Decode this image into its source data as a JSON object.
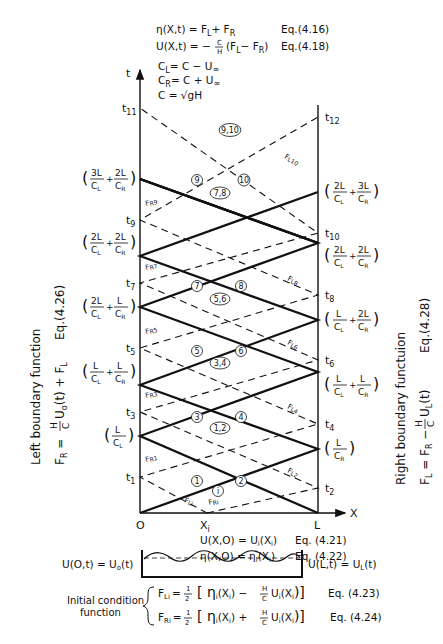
{
  "header_equations": {
    "eta": {
      "lhs": "η(X,t) = F",
      "sub1": "L",
      "mid": "+ F",
      "sub2": "R",
      "ref": "Eq.(4.16)"
    },
    "u": {
      "lhs": "U(X,t) = −",
      "frac_num": "C",
      "frac_den": "H",
      "rest": "(F",
      "sub1": "L",
      "mid": "− F",
      "sub2": "R",
      "close": ")",
      "ref": "Eq.(4.18)"
    },
    "cl": {
      "lhs": "C",
      "sub": "L",
      "rhs": "= C − U",
      "tail": "∞"
    },
    "cr": {
      "lhs": "C",
      "sub": "R",
      "rhs": "= C + U",
      "tail": "∞"
    },
    "c": {
      "text": "C = √gH"
    }
  },
  "axes": {
    "t_label": "t",
    "x_label": "X",
    "origin": "O",
    "right_end": "L",
    "xi": "X",
    "xi_sub": "i"
  },
  "left_time_marks": [
    {
      "id": "t1",
      "base": "t",
      "sub": "1"
    },
    {
      "id": "t3",
      "base": "t",
      "sub": "3"
    },
    {
      "id": "t5",
      "base": "t",
      "sub": "5"
    },
    {
      "id": "t7",
      "base": "t",
      "sub": "7"
    },
    {
      "id": "t9",
      "base": "t",
      "sub": "9"
    },
    {
      "id": "t11",
      "base": "t",
      "sub": "11"
    }
  ],
  "right_time_marks": [
    {
      "id": "t2",
      "base": "t",
      "sub": "2"
    },
    {
      "id": "t4",
      "base": "t",
      "sub": "4"
    },
    {
      "id": "t6",
      "base": "t",
      "sub": "6"
    },
    {
      "id": "t8",
      "base": "t",
      "sub": "8"
    },
    {
      "id": "t10",
      "base": "t",
      "sub": "10"
    },
    {
      "id": "t12",
      "base": "t",
      "sub": "12"
    }
  ],
  "left_time_expressions": [
    {
      "terms": [
        {
          "num": "L",
          "den": "C",
          "den_sub": "L"
        }
      ]
    },
    {
      "terms": [
        {
          "num": "L",
          "den": "C",
          "den_sub": "L"
        },
        {
          "num": "L",
          "den": "C",
          "den_sub": "R"
        }
      ]
    },
    {
      "terms": [
        {
          "num": "2L",
          "den": "C",
          "den_sub": "L"
        },
        {
          "num": "L",
          "den": "C",
          "den_sub": "R"
        }
      ]
    },
    {
      "terms": [
        {
          "num": "2L",
          "den": "C",
          "den_sub": "L"
        },
        {
          "num": "2L",
          "den": "C",
          "den_sub": "R"
        }
      ]
    },
    {
      "terms": [
        {
          "num": "3L",
          "den": "C",
          "den_sub": "L"
        },
        {
          "num": "2L",
          "den": "C",
          "den_sub": "R"
        }
      ]
    }
  ],
  "right_time_expressions": [
    {
      "terms": [
        {
          "num": "L",
          "den": "C",
          "den_sub": "R"
        }
      ]
    },
    {
      "terms": [
        {
          "num": "L",
          "den": "C",
          "den_sub": "L"
        },
        {
          "num": "L",
          "den": "C",
          "den_sub": "R"
        }
      ]
    },
    {
      "terms": [
        {
          "num": "L",
          "den": "C",
          "den_sub": "L"
        },
        {
          "num": "2L",
          "den": "C",
          "den_sub": "R"
        }
      ]
    },
    {
      "terms": [
        {
          "num": "2L",
          "den": "C",
          "den_sub": "L"
        },
        {
          "num": "2L",
          "den": "C",
          "den_sub": "R"
        }
      ]
    },
    {
      "terms": [
        {
          "num": "2L",
          "den": "C",
          "den_sub": "L"
        },
        {
          "num": "3L",
          "den": "C",
          "den_sub": "R"
        }
      ]
    }
  ],
  "region_labels": [
    "i",
    "1",
    "2",
    "1,2",
    "3",
    "4",
    "3,4",
    "5",
    "6",
    "5,6",
    "7",
    "8",
    "7,8",
    "9",
    "10",
    "9,10"
  ],
  "characteristic_labels": {
    "left_side": [
      "F",
      "R1",
      "R3",
      "R5",
      "R7",
      "R9"
    ],
    "right_side": [
      "L2",
      "L4",
      "L6",
      "L8",
      "L10"
    ],
    "bottom": [
      "Li",
      "Ri"
    ],
    "left_top": "Ri"
  },
  "left_boundary": {
    "title": "Left boundary function",
    "formula": "F",
    "formula_sub": "R",
    "eq_mid": " = ",
    "frac_num": "H",
    "frac_den": "C",
    "after_frac": " U",
    "u_sub": "o",
    "tail": "(t) + F",
    "tail_sub": "L",
    "ref": "Eq.(4.26)"
  },
  "right_boundary": {
    "title": "Right boundary functuion",
    "formula": "F",
    "formula_sub": "L",
    "eq_mid": " = F",
    "fr_sub": "R",
    "minus": " − ",
    "frac_num": "H",
    "frac_den": "C",
    "after_frac": " U",
    "u_sub": "L",
    "tail": "(t)",
    "ref": "Eq.(4.28)"
  },
  "initial_equations": {
    "u0": {
      "text": "U(X,O) = U",
      "sub": "i",
      "arg": "(X",
      "arg_sub": "i",
      "close": ")",
      "ref": "Eq. (4.21)"
    },
    "eta0": {
      "text": "η(X,O) = η",
      "sub": "i",
      "arg": "(X",
      "arg_sub": "i",
      "close": ")",
      "ref": "Eq. (4.22)"
    }
  },
  "channel": {
    "left_bc": "U(O,t) = U",
    "left_bc_sub": "o",
    "left_bc_tail": "(t)",
    "right_bc": "U(L,t) = U",
    "right_bc_sub": "L",
    "right_bc_tail": "(t)"
  },
  "initial_condition": {
    "label_line1": "Initial condition",
    "label_line2": "function",
    "fl": {
      "lhs": "F",
      "sub": "Li",
      "eq": "=",
      "half_num": "1",
      "half_den": "2",
      "body1": "[ η",
      "body_sub": "i",
      "body2": "(X",
      "body_sub2": "i",
      "body3": ") −",
      "frac_num": "H",
      "frac_den": "C",
      "body4": "U",
      "body_sub3": "i",
      "body5": "(X",
      "body_sub4": "i",
      "body6": ")]",
      "ref": "Eq. (4.23)"
    },
    "fr": {
      "lhs": "F",
      "sub": "Ri",
      "eq": "=",
      "half_num": "1",
      "half_den": "2",
      "body1": "[ η",
      "body_sub": "i",
      "body2": "(X",
      "body_sub2": "i",
      "body3": ") +",
      "frac_num": "H",
      "frac_den": "C",
      "body4": "U",
      "body_sub3": "i",
      "body5": "(X",
      "body_sub4": "i",
      "body6": ")]",
      "ref": "Eq. (4.24)"
    }
  }
}
